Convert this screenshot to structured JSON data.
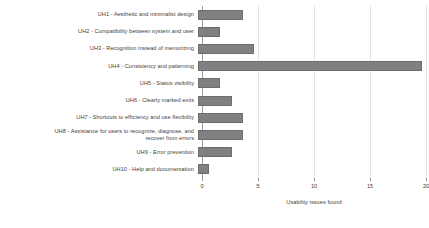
{
  "chart_data": {
    "type": "bar",
    "orientation": "horizontal",
    "title": "",
    "xlabel": "Usability issues found",
    "ylabel": "",
    "xlim": [
      0,
      20
    ],
    "xticks": [
      0,
      5,
      10,
      15,
      20
    ],
    "xtick_labels": [
      "0",
      "5",
      "10",
      "15",
      "20"
    ],
    "grid": true,
    "legend": false,
    "bar_color": "#808080",
    "categories": [
      "UH1 - Aesthetic and minimalist design",
      "UH2 - Compatibility between system and user",
      "UH3 - Recognition instead of memorizing",
      "UH4 - Consistency and patterning",
      "UH5 - Status visibility",
      "UH6 - Clearly marked exits",
      "UH7 - Shortcuts to efficiency and use flexibility",
      "UH8 - Assistance for users to recognize, diagnose, and\nrecover from errors",
      "UH9 - Error prevention",
      "UH10 - Help and documentation"
    ],
    "values": [
      4,
      2,
      5,
      20,
      2,
      3,
      4,
      4,
      3,
      1
    ]
  }
}
